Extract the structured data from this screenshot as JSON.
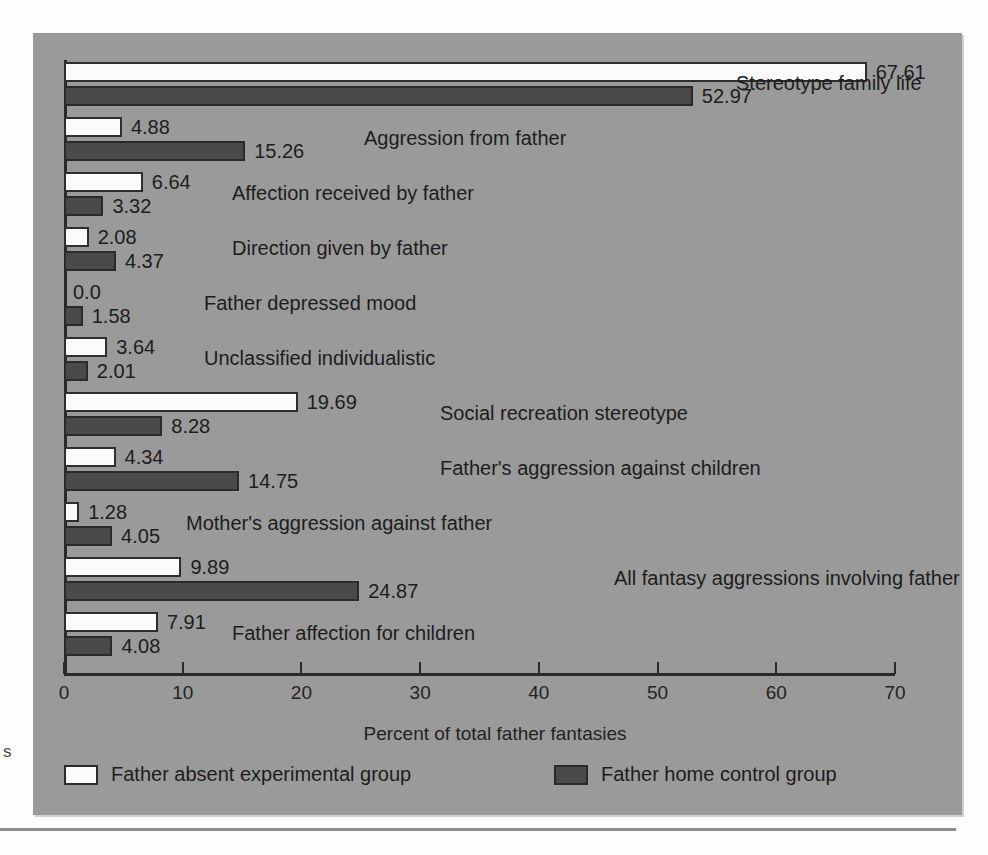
{
  "margin_fragment": "s",
  "chart_data": {
    "type": "bar",
    "orientation": "horizontal",
    "title": "",
    "xlabel": "Percent of total father fantasies",
    "ylabel": "",
    "xlim": [
      0,
      70
    ],
    "xticks": [
      0,
      10,
      20,
      30,
      40,
      50,
      60,
      70
    ],
    "xticklabels": [
      "0",
      "10",
      "20",
      "30",
      "40",
      "50",
      "60",
      "70"
    ],
    "grid": false,
    "legend_position": "below-axis",
    "categories": [
      "Stereotype family life",
      "Aggression from father",
      "Affection received by father",
      "Direction given by father",
      "Father depressed mood",
      "Unclassified individualistic",
      "Social recreation stereotype",
      "Father's aggression against children",
      "Mother's aggression against father",
      "All fantasy aggressions involving father",
      "Father affection for children"
    ],
    "series": [
      {
        "name": "Father absent experimental group",
        "color": "#fbfbf9",
        "values": [
          67.61,
          4.88,
          6.64,
          2.08,
          0.0,
          3.64,
          19.69,
          4.34,
          1.28,
          9.89,
          7.91
        ],
        "value_labels": [
          "67.61",
          "4.88",
          "6.64",
          "2.08",
          "0.0",
          "3.64",
          "19.69",
          "4.34",
          "1.28",
          "9.89",
          "7.91"
        ]
      },
      {
        "name": "Father home control group",
        "color": "#4a4a4a",
        "values": [
          52.97,
          15.26,
          3.32,
          4.37,
          1.58,
          2.01,
          8.28,
          14.75,
          4.05,
          24.87,
          4.08
        ],
        "value_labels": [
          "52.97",
          "15.26",
          "3.32",
          "4.37",
          "1.58",
          "2.01",
          "8.28",
          "14.75",
          "4.05",
          "24.87",
          "4.08"
        ]
      }
    ]
  },
  "legend": {
    "entries": [
      {
        "label": "Father absent experimental group",
        "swatch": "light"
      },
      {
        "label": "Father home control group",
        "swatch": "dark"
      }
    ]
  }
}
